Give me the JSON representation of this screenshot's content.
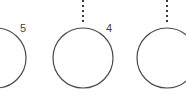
{
  "diagram": {
    "stroke_color": "#4a4a4a",
    "nodes": [
      {
        "id": "node-5",
        "label": "5",
        "cx": -4,
        "cy": 58,
        "r": 30,
        "label_x": 20,
        "label_y": 23
      },
      {
        "id": "node-4",
        "label": "4",
        "cx": 83,
        "cy": 58,
        "r": 30,
        "label_x": 106,
        "label_y": 23
      },
      {
        "id": "node-3",
        "label": "",
        "cx": 167,
        "cy": 58,
        "r": 30
      }
    ],
    "edges": [
      {
        "id": "edge-to-node-4",
        "x": 83,
        "y1": 0,
        "y2": 23,
        "style": "dotted"
      },
      {
        "id": "edge-to-node-3",
        "x": 167,
        "y1": 0,
        "y2": 23,
        "style": "dotted"
      }
    ]
  }
}
